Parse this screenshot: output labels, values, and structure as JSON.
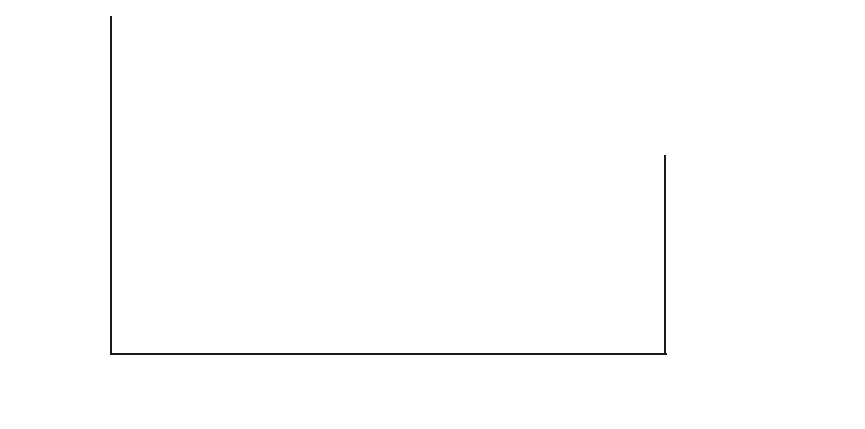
{
  "chart_data": {
    "type": "area",
    "title": "",
    "xlabel": "",
    "ylabel": "kg active ingredient (in thousands)",
    "categories": [
      "1987",
      "1988",
      "1989",
      "1990",
      "1991"
    ],
    "x": [
      1987,
      1988,
      1989,
      1990,
      1991
    ],
    "ylim": [
      0,
      200
    ],
    "yticks": [
      0,
      50,
      100,
      150,
      200
    ],
    "ytick_labels": [
      "0",
      "50",
      "100",
      "150",
      "200"
    ],
    "grid": false,
    "stacked": true,
    "legend_position": "right",
    "series": [
      {
        "name": "forestry",
        "values": [
          57,
          61,
          100,
          85,
          85
        ],
        "color": "#969696"
      },
      {
        "name": "utilities",
        "values": [
          19,
          14,
          28,
          8,
          8
        ],
        "color": "#787878"
      },
      {
        "name": "mosquitos",
        "values": [
          24,
          26,
          22,
          22,
          7
        ],
        "color": "#dcdcdc"
      },
      {
        "name": "rail and road",
        "values": [
          27,
          25,
          14,
          28,
          9
        ],
        "color": "#8a8a8a"
      },
      {
        "name": "miscellaneous",
        "values": [
          1,
          3,
          7,
          2,
          3
        ],
        "color": "#c9c9c9"
      }
    ],
    "cumulative_totals": [
      128,
      129,
      171,
      145,
      112
    ],
    "legend_order": [
      "miscellaneous",
      "rail and road",
      "mosquitos",
      "utilities",
      "forestry"
    ]
  },
  "legend": {
    "items": [
      {
        "label": "miscellaneous",
        "color": "#c9c9c9"
      },
      {
        "label": "rail and road",
        "color": "#8a8a8a"
      },
      {
        "label": "mosquitos",
        "color": "#dcdcdc"
      },
      {
        "label": "utilities",
        "color": "#787878"
      },
      {
        "label": "forestry",
        "color": "#969696"
      }
    ]
  },
  "axes": {
    "y_title": "kg active ingredient (in thousands)",
    "y_ticks": [
      "200",
      "150",
      "100",
      "50",
      "0"
    ],
    "x_ticks": [
      "1987",
      "1988",
      "1989",
      "1990",
      "1991"
    ]
  }
}
